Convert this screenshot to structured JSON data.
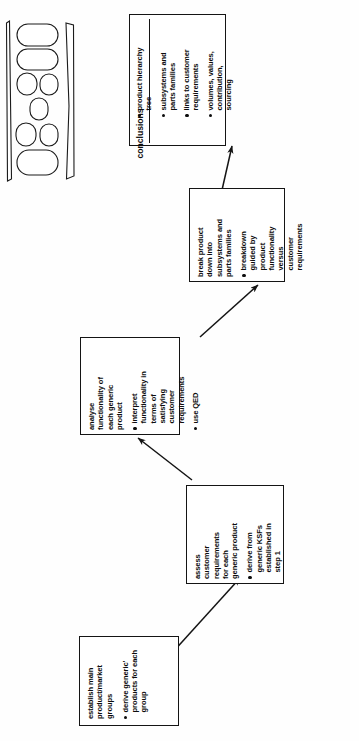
{
  "diagram": {
    "orientation": "rotated-90-ccw",
    "line_color": "#141414",
    "text_color": "#0d0d0d",
    "background": "#ffffff",
    "steps": [
      {
        "id": "step-1",
        "heading": "establish main\nproduct/market\ngroups",
        "bullets": [
          "derive generic'\nproducts for each\ngroup"
        ]
      },
      {
        "id": "step-2",
        "heading": "assess\ncustomer\nrequirements\nfor each\ngeneric product",
        "bullets": [
          "derive from\ngeneric KSFs\nestablished in\nstep 1"
        ]
      },
      {
        "id": "step-3",
        "heading": "analyse\nfunctionality of\neach generic\nproduct",
        "bullets": [
          "interpret\nfunctionality in\nterms of\nsatisfying\ncustomer\nrequirements",
          "use QED"
        ]
      },
      {
        "id": "step-4",
        "heading": "break product\ndown into\nsubsystems and\nparts families",
        "bullets": [
          "breakdown\nguided by\nproduct\nfunctionality\nversus\ncustomer\nrequirements"
        ]
      }
    ],
    "conclusions": {
      "title": "conclusions",
      "bullets": [
        "product hierarchy\ntree",
        "subsystems and\nparts families",
        "links to customer\nrequirements",
        "volumes, values,\ncontribution,\nsourcing"
      ]
    },
    "connectors": [
      {
        "from": "step-1",
        "to": "step-2"
      },
      {
        "from": "step-2",
        "to": "step-3"
      },
      {
        "from": "step-3",
        "to": "step-4"
      },
      {
        "from": "step-4",
        "to": "conclusions"
      }
    ]
  },
  "artifact": {
    "name": "page-edge-scan-artifact",
    "shapes": "rounded-capsule-cluster"
  }
}
